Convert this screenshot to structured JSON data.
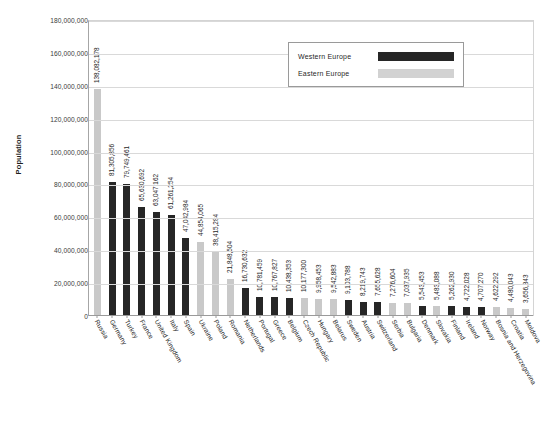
{
  "chart_data": {
    "type": "bar",
    "title": "",
    "xlabel": "",
    "ylabel": "Population",
    "ylim": [
      0,
      180000000
    ],
    "ytick_step": 20000000,
    "grid": true,
    "legend_position": "top-right",
    "categories": [
      "Russia",
      "Germany",
      "Turkey",
      "France",
      "United Kingdom",
      "Italy",
      "Spain",
      "Ukraine",
      "Poland",
      "Romania",
      "Netherlands",
      "Portugal",
      "Greece",
      "Belgium",
      "Czech Republic",
      "Hungary",
      "Belarus",
      "Sweden",
      "Austria",
      "Switzerland",
      "Serbia",
      "Bulgaria",
      "Denmark",
      "Slovakia",
      "Finland",
      "Ireland",
      "Norway",
      "Bosnia and Herzegovina",
      "Croatia",
      "Moldova"
    ],
    "values": [
      138082178,
      81305856,
      79749461,
      65630692,
      63047162,
      61261254,
      47042984,
      44854065,
      38415284,
      21848504,
      16730632,
      10781459,
      10767827,
      10438353,
      10177300,
      9958453,
      9542883,
      9103788,
      8219743,
      7655628,
      7276604,
      7037935,
      5543453,
      5483088,
      5262930,
      4722028,
      4707270,
      4622292,
      4480043,
      3656843
    ],
    "value_labels": [
      "138,082,178",
      "81,305,856",
      "79,749,461",
      "65,630,692",
      "63,047,162",
      "61,261,254",
      "47,042,984",
      "44,854,065",
      "38,415,284",
      "21,848,504",
      "16,730,632",
      "10,781,459",
      "10,767,827",
      "10,438,353",
      "10,177,300",
      "9,958,453",
      "9,542,883",
      "9,103,788",
      "8,219,743",
      "7,655,628",
      "7,276,604",
      "7,037,935",
      "5,543,453",
      "5,483,088",
      "5,262,930",
      "4,722,028",
      "4,707,270",
      "4,622,292",
      "4,480,043",
      "3,656,843"
    ],
    "groups": [
      "east",
      "west",
      "west",
      "west",
      "west",
      "west",
      "west",
      "east",
      "east",
      "east",
      "west",
      "west",
      "west",
      "west",
      "east",
      "east",
      "east",
      "west",
      "west",
      "west",
      "east",
      "east",
      "west",
      "east",
      "west",
      "west",
      "west",
      "east",
      "east",
      "east"
    ],
    "ytick_labels": [
      "180,000,000",
      "160,000,000",
      "140,000,000",
      "120,000,000",
      "100,000,000",
      "80,000,000",
      "60,000,000",
      "40,000,000",
      "20,000,000",
      "0"
    ],
    "ytick_values": [
      180000000,
      160000000,
      140000000,
      120000000,
      100000000,
      80000000,
      60000000,
      40000000,
      20000000,
      0
    ],
    "series": [
      {
        "name": "Western Europe",
        "color": "#262626"
      },
      {
        "name": "Eastern Europe",
        "color": "#c9c9c9"
      }
    ]
  },
  "legend": {
    "items": [
      {
        "label": "Western Europe",
        "key": "west"
      },
      {
        "label": "Eastern Europe",
        "key": "east"
      }
    ]
  }
}
